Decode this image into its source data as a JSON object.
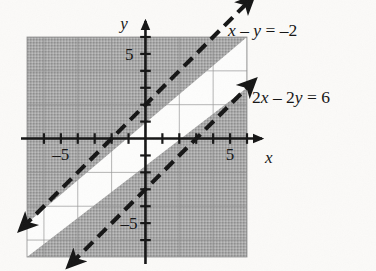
{
  "figure": {
    "kind": "coordinate-plane-graph",
    "background_color": "#fbfaf8",
    "ink_color": "#151515",
    "shade_color": "#9e9e9e",
    "grid_color": "#8a8a8a",
    "plot_box": {
      "x_min": -7,
      "x_max": 6,
      "y_min": -7,
      "y_max": 6
    }
  },
  "axes": {
    "x_axis_label": "x",
    "y_axis_label": "y",
    "x_tick_labels": [
      {
        "value": -5,
        "text": "–5"
      },
      {
        "value": 5,
        "text": "5"
      }
    ],
    "y_tick_labels": [
      {
        "value": 5,
        "text": "5"
      },
      {
        "value": -5,
        "text": "–5"
      }
    ],
    "tick_interval": 1,
    "grid_interval": 2,
    "grid": true
  },
  "labels": {
    "line1": {
      "text": "x – y = –2",
      "parts": [
        {
          "t": "x",
          "italic": true
        },
        {
          "t": " – ",
          "italic": false
        },
        {
          "t": "y",
          "italic": true
        },
        {
          "t": " = –2",
          "italic": false
        }
      ]
    },
    "line2": {
      "text": "2x – 2y = 6",
      "parts": [
        {
          "t": "2",
          "italic": false
        },
        {
          "t": "x",
          "italic": true
        },
        {
          "t": " – 2",
          "italic": false
        },
        {
          "t": "y",
          "italic": true
        },
        {
          "t": " = 6",
          "italic": false
        }
      ]
    }
  },
  "chart_data": {
    "type": "line",
    "title": "",
    "xlabel": "x",
    "ylabel": "y",
    "xlim": [
      -7,
      6
    ],
    "ylim": [
      -7,
      6
    ],
    "grid": true,
    "grid_interval": 2,
    "tick_interval": 1,
    "xticks": [
      -5,
      5
    ],
    "yticks": [
      -5,
      5
    ],
    "legend": "inline-annotations",
    "series": [
      {
        "name": "x – y = –2",
        "equation": "x - y = -2",
        "slope_intercept": "y = x + 2",
        "slope": 1,
        "intercept": 2,
        "style": "dashed",
        "arrows": "both",
        "points": [
          [
            -7,
            -5
          ],
          [
            6,
            8
          ]
        ],
        "x_intercept": -2,
        "y_intercept": 2
      },
      {
        "name": "2x – 2y = 6",
        "equation": "2x - 2y = 6",
        "slope_intercept": "y = x - 3",
        "slope": 1,
        "intercept": -3,
        "style": "dashed",
        "arrows": "both",
        "points": [
          [
            -4,
            -7
          ],
          [
            6,
            3
          ]
        ],
        "x_intercept": 3,
        "y_intercept": -3
      }
    ],
    "shaded_regions": [
      {
        "name": "above-line-1",
        "inequality": "x - y < -2",
        "description": "region above and left of the line x – y = –2",
        "fill": "#9e9e9e",
        "boundary": "dashed-excluded"
      },
      {
        "name": "below-line-2",
        "inequality": "2x - 2y > 6",
        "description": "region below and right of the line 2x – 2y = 6",
        "fill": "#9e9e9e",
        "boundary": "dashed-excluded"
      }
    ],
    "annotations": [
      {
        "text": "x – y = –2",
        "at": [
          6.2,
          6.6
        ]
      },
      {
        "text": "2x – 2y = 6",
        "at": [
          6.6,
          2.6
        ]
      }
    ]
  }
}
